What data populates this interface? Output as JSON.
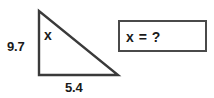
{
  "figure": {
    "type": "right-triangle",
    "labels": {
      "hypotenuse": "x",
      "vertical_leg": "9.7",
      "base": "5.4"
    },
    "stroke_color": "#3a3a3a",
    "fill_color": "#ffffff"
  },
  "answer_box": {
    "text": "x = ?",
    "border_color": "#4a4a4a",
    "background_color": "#ffffff"
  }
}
